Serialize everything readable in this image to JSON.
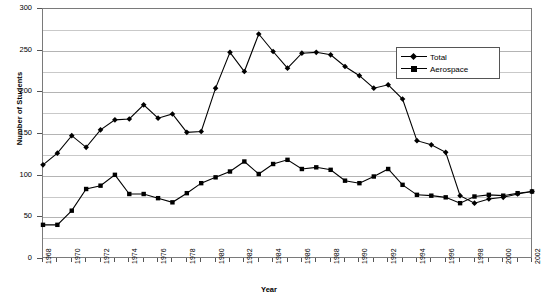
{
  "chart_data": {
    "type": "line",
    "title": "",
    "xlabel": "Year",
    "ylabel": "Number of Students",
    "xlim": [
      1968,
      2002
    ],
    "ylim": [
      0,
      300
    ],
    "ytick_step": 50,
    "grid_step": 25,
    "grid": true,
    "legend_position": "top-right",
    "x": [
      1968,
      1969,
      1970,
      1971,
      1972,
      1973,
      1974,
      1975,
      1976,
      1977,
      1978,
      1979,
      1980,
      1981,
      1982,
      1983,
      1984,
      1985,
      1986,
      1987,
      1988,
      1989,
      1990,
      1991,
      1992,
      1993,
      1994,
      1995,
      1996,
      1997,
      1998,
      1999,
      2000,
      2001,
      2002
    ],
    "yticks": [
      0,
      50,
      100,
      150,
      200,
      250,
      300
    ],
    "xticks": [
      1968,
      1970,
      1972,
      1974,
      1976,
      1978,
      1980,
      1982,
      1984,
      1986,
      1988,
      1990,
      1992,
      1994,
      1996,
      1998,
      2000,
      2002
    ],
    "series": [
      {
        "name": "Total",
        "marker": "diamond",
        "values": [
          113,
          127,
          148,
          134,
          155,
          167,
          168,
          185,
          169,
          174,
          152,
          153,
          205,
          248,
          225,
          270,
          249,
          229,
          247,
          248,
          245,
          231,
          220,
          205,
          209,
          192,
          142,
          137,
          128,
          76,
          67,
          72,
          74,
          78,
          81
        ]
      },
      {
        "name": "Aerospace",
        "marker": "square",
        "values": [
          41,
          41,
          58,
          84,
          88,
          101,
          78,
          78,
          73,
          68,
          79,
          91,
          98,
          105,
          117,
          102,
          114,
          119,
          108,
          110,
          107,
          94,
          91,
          99,
          108,
          89,
          77,
          76,
          74,
          67,
          75,
          77,
          76,
          79,
          81
        ]
      }
    ]
  },
  "legend": {
    "items": [
      {
        "label": "Total"
      },
      {
        "label": "Aerospace"
      }
    ]
  },
  "axes": {
    "y_title": "Number of Students",
    "x_title": "Year"
  }
}
